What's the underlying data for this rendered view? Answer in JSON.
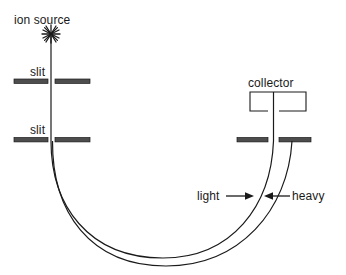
{
  "figure": {
    "type": "mass-spectrometer-schematic",
    "background_color": "#ffffff",
    "stroke_color": "#1a1a1a",
    "bar_fill_color": "#4d4d4d",
    "labels": {
      "ion_source": "ion source",
      "slit_1": "slit",
      "slit_2": "slit",
      "collector": "collector",
      "light": "light",
      "heavy": "heavy"
    },
    "icons": {
      "ion_source": "asterisk-star-icon",
      "light_arrow": "arrow-right-icon",
      "heavy_arrow": "arrow-left-icon"
    },
    "components": {
      "ion_source_point": {
        "x": 51,
        "y": 36
      },
      "beam_line": {
        "x": 51,
        "y1": 36,
        "y2": 141
      },
      "slit_1": {
        "y": 82,
        "left_bar": [
          14,
          48
        ],
        "right_bar": [
          55,
          90
        ]
      },
      "slit_2": {
        "y": 140,
        "left_bar": [
          14,
          48
        ],
        "right_bar": [
          55,
          90
        ]
      },
      "collector_box": {
        "x": 250,
        "y": 92,
        "width": 56,
        "height": 19,
        "open_bottom_gap": [
          268,
          279
        ]
      },
      "collector_line": {
        "x": 273,
        "y1": 92,
        "y2": 141
      },
      "slit_3": {
        "y": 140,
        "left_bar": [
          237,
          268
        ],
        "right_bar": [
          279,
          311
        ]
      },
      "light_path": "inner curve from slit-2 gap around to collector slit gap",
      "heavy_path": "outer curve from slit-2 gap around to right bar of collector slit"
    }
  }
}
